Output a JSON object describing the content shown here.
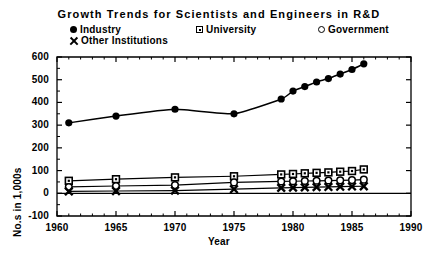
{
  "chart_data": {
    "type": "scatter",
    "title": "Growth Trends for Scientists and Engineers in R&D",
    "xlabel": "Year",
    "ylabel": "No.s in 1,000s",
    "xlim": [
      1960,
      1990
    ],
    "ylim": [
      -100,
      600
    ],
    "xticks": [
      1960,
      1965,
      1970,
      1975,
      1980,
      1985,
      1990
    ],
    "yticks": [
      -100,
      0,
      100,
      200,
      300,
      400,
      500,
      600
    ],
    "xtick_labels": [
      "1960",
      "1965",
      "1970",
      "1975",
      "1980",
      "1985",
      "1990"
    ],
    "ytick_labels": [
      "-100",
      "0",
      "100",
      "200",
      "300",
      "400",
      "500",
      "600"
    ],
    "grid": false,
    "legend_position": "top",
    "x": [
      1961,
      1965,
      1970,
      1975,
      1979,
      1980,
      1981,
      1982,
      1983,
      1984,
      1985,
      1986
    ],
    "series": [
      {
        "name": "Industry",
        "marker": "filled-circle",
        "fitted_curve": true,
        "values": [
          310,
          340,
          370,
          350,
          415,
          450,
          470,
          490,
          505,
          525,
          545,
          570
        ]
      },
      {
        "name": "University",
        "marker": "square",
        "fitted_curve": false,
        "values": [
          55,
          62,
          70,
          75,
          83,
          85,
          88,
          90,
          92,
          95,
          98,
          105
        ]
      },
      {
        "name": "Government",
        "marker": "open-circle",
        "fitted_curve": false,
        "values": [
          28,
          32,
          36,
          48,
          52,
          53,
          54,
          55,
          56,
          57,
          58,
          60
        ]
      },
      {
        "name": "Other Institutions",
        "marker": "x-cross",
        "fitted_curve": false,
        "values": [
          8,
          10,
          12,
          18,
          24,
          25,
          26,
          27,
          28,
          29,
          30,
          31
        ]
      }
    ]
  },
  "legend": {
    "industry": "Industry",
    "university": "University",
    "government": "Government",
    "other": "Other  Institutions"
  },
  "colors": {
    "ink": "#000000",
    "paper": "#ffffff"
  }
}
